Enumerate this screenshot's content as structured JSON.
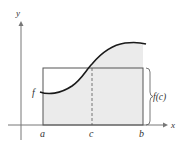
{
  "diagram": {
    "axes": {
      "x_label": "x",
      "y_label": "y"
    },
    "labels": {
      "function": "f",
      "a": "a",
      "c": "c",
      "b": "b",
      "height": "f(c)"
    },
    "colors": {
      "curve": "#1a1a1a",
      "axis": "#777777",
      "rectangle": "#555555",
      "shading": "#ebebeb",
      "text": "#333333"
    }
  }
}
